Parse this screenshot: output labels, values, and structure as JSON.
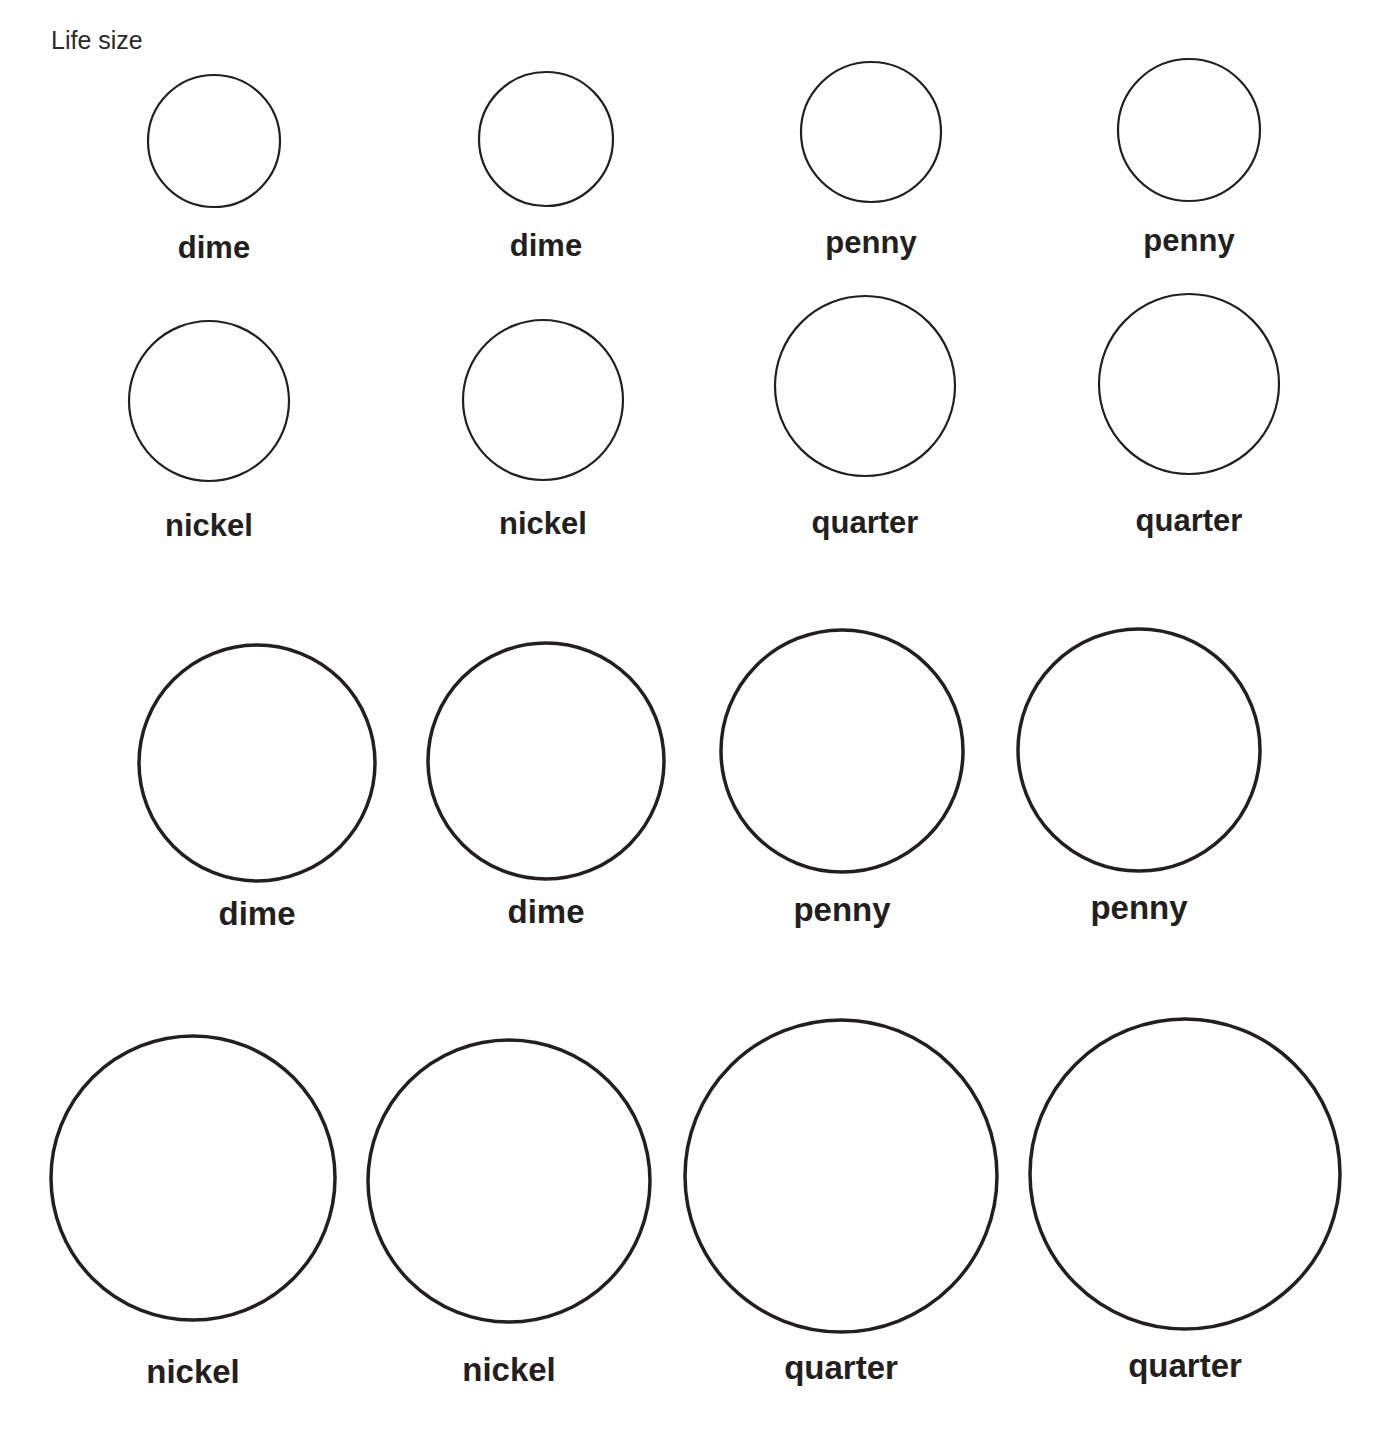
{
  "header": {
    "title": "Life size"
  },
  "sections": [
    {
      "name": "life-size",
      "coins": [
        {
          "label": "dime",
          "cx": 214,
          "cy": 141,
          "r": 66,
          "stroke": 2.2,
          "ly": 230,
          "small": true
        },
        {
          "label": "dime",
          "cx": 546,
          "cy": 139,
          "r": 67,
          "stroke": 2.2,
          "ly": 228,
          "small": true
        },
        {
          "label": "penny",
          "cx": 871,
          "cy": 132,
          "r": 70,
          "stroke": 2.2,
          "ly": 225,
          "small": true
        },
        {
          "label": "penny",
          "cx": 1189,
          "cy": 130,
          "r": 71,
          "stroke": 2.2,
          "ly": 223,
          "small": true
        },
        {
          "label": "nickel",
          "cx": 209,
          "cy": 401,
          "r": 80,
          "stroke": 2.2,
          "ly": 508,
          "small": true
        },
        {
          "label": "nickel",
          "cx": 543,
          "cy": 400,
          "r": 80,
          "stroke": 2.2,
          "ly": 506,
          "small": true
        },
        {
          "label": "quarter",
          "cx": 865,
          "cy": 386,
          "r": 90,
          "stroke": 2.2,
          "ly": 505,
          "small": true
        },
        {
          "label": "quarter",
          "cx": 1189,
          "cy": 384,
          "r": 90,
          "stroke": 2.2,
          "ly": 503,
          "small": true
        }
      ]
    },
    {
      "name": "enlarged",
      "coins": [
        {
          "label": "dime",
          "cx": 257,
          "cy": 763,
          "r": 118,
          "stroke": 3.5,
          "ly": 895,
          "small": false
        },
        {
          "label": "dime",
          "cx": 546,
          "cy": 761,
          "r": 118,
          "stroke": 3.5,
          "ly": 893,
          "small": false
        },
        {
          "label": "penny",
          "cx": 842,
          "cy": 751,
          "r": 121,
          "stroke": 3.5,
          "ly": 891,
          "small": false
        },
        {
          "label": "penny",
          "cx": 1139,
          "cy": 750,
          "r": 121,
          "stroke": 3.5,
          "ly": 889,
          "small": false
        },
        {
          "label": "nickel",
          "cx": 193,
          "cy": 1178,
          "r": 142,
          "stroke": 3.5,
          "ly": 1353,
          "small": false
        },
        {
          "label": "nickel",
          "cx": 509,
          "cy": 1181,
          "r": 141,
          "stroke": 3.5,
          "ly": 1351,
          "small": false
        },
        {
          "label": "quarter",
          "cx": 841,
          "cy": 1176,
          "r": 156,
          "stroke": 3.5,
          "ly": 1349,
          "small": false
        },
        {
          "label": "quarter",
          "cx": 1185,
          "cy": 1174,
          "r": 155,
          "stroke": 3.5,
          "ly": 1347,
          "small": false
        }
      ]
    }
  ]
}
